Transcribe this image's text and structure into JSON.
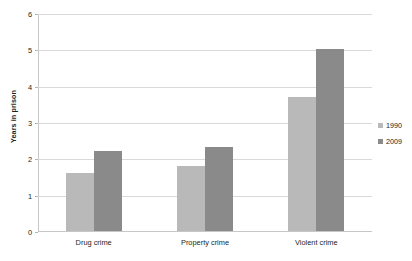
{
  "chart_data": {
    "type": "bar",
    "title": "",
    "subtitle": "",
    "xlabel": "",
    "ylabel": "Years in prison",
    "categories": [
      "Drug crime",
      "Property crime",
      "Violent crime"
    ],
    "series": [
      {
        "name": "1990",
        "color": "#b9b9b9",
        "values": [
          1.6,
          1.8,
          3.7
        ]
      },
      {
        "name": "2009",
        "color": "#8a8a8a",
        "values": [
          2.2,
          2.3,
          5.0
        ]
      }
    ],
    "ylim": [
      0,
      6
    ],
    "yticks": [
      0,
      1,
      2,
      3,
      4,
      5,
      6
    ],
    "ytick_labels": [
      "0",
      "1",
      "2",
      "3",
      "4",
      "5",
      "6"
    ],
    "grid": true,
    "grid_axis": "y",
    "legend_position": "right",
    "background_color": "#ffffff",
    "grid_color": "#d9d9d9",
    "axis_color": "#c7c7c7",
    "text_color": "#231f20"
  }
}
